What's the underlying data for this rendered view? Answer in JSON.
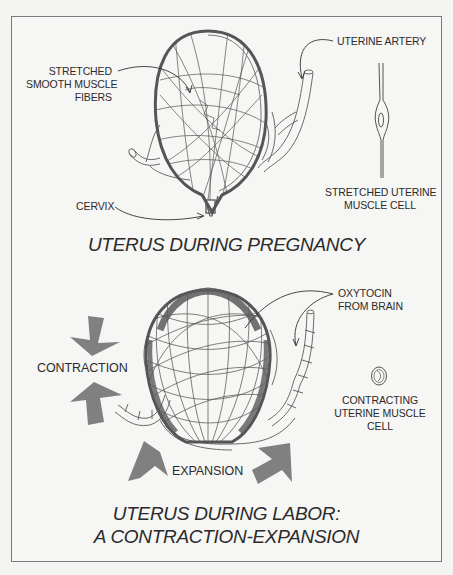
{
  "diagram": {
    "pregnancy": {
      "title": "UTERUS DURING PREGNANCY",
      "labels": {
        "fibers": [
          "STRETCHED",
          "SMOOTH MUSCLE",
          "FIBERS"
        ],
        "artery": "UTERINE ARTERY",
        "cervix": "CERVIX",
        "cell": [
          "STRETCHED UTERINE",
          "MUSCLE CELL"
        ]
      }
    },
    "labor": {
      "title": [
        "UTERUS DURING LABOR:",
        "A CONTRACTION-EXPANSION"
      ],
      "labels": {
        "oxytocin": [
          "OXYTOCIN",
          "FROM BRAIN"
        ],
        "contraction": "CONTRACTION",
        "expansion": "EXPANSION",
        "cell": [
          "CONTRACTING",
          "UTERINE MUSCLE",
          "CELL"
        ]
      }
    },
    "colors": {
      "outline": "#5a5a5a",
      "fiber": "#555555",
      "arrow": "#7f7f7f",
      "frame": "#7a7a7a",
      "background": "#f6f6f4"
    }
  }
}
